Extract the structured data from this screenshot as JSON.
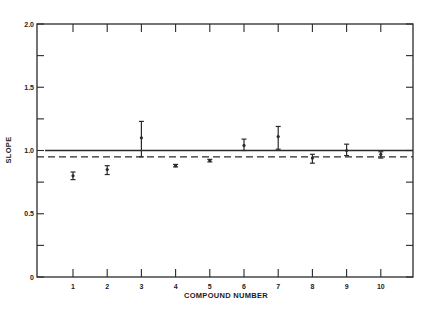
{
  "chart_data": {
    "type": "scatter",
    "title": "",
    "xlabel": "COMPOUND NUMBER",
    "ylabel": "SLOPE",
    "xlim": [
      0,
      11
    ],
    "ylim": [
      0,
      2.0
    ],
    "x_ticks": [
      "1",
      "2",
      "3",
      "4",
      "5",
      "6",
      "7",
      "8",
      "9",
      "10"
    ],
    "y_ticks": [
      "0",
      "0.5",
      "1.0",
      "1.5",
      "2.0"
    ],
    "y_minor_ticks": [
      0.25,
      0.75,
      1.25,
      1.75
    ],
    "grid": false,
    "legend": null,
    "series": [
      {
        "name": "slope",
        "style": "point-with-error-bars",
        "points": [
          {
            "x": 1,
            "y": 0.8,
            "err_low": 0.77,
            "err_high": 0.83
          },
          {
            "x": 2,
            "y": 0.85,
            "err_low": 0.81,
            "err_high": 0.88
          },
          {
            "x": 3,
            "y": 1.1,
            "err_low": 0.95,
            "err_high": 1.23
          },
          {
            "x": 4,
            "y": 0.88,
            "err_low": 0.87,
            "err_high": 0.89
          },
          {
            "x": 5,
            "y": 0.92,
            "err_low": 0.91,
            "err_high": 0.93
          },
          {
            "x": 6,
            "y": 1.04,
            "err_low": 1.0,
            "err_high": 1.09
          },
          {
            "x": 7,
            "y": 1.11,
            "err_low": 1.01,
            "err_high": 1.19
          },
          {
            "x": 8,
            "y": 0.94,
            "err_low": 0.9,
            "err_high": 0.97
          },
          {
            "x": 9,
            "y": 1.0,
            "err_low": 0.96,
            "err_high": 1.05
          },
          {
            "x": 10,
            "y": 0.97,
            "err_low": 0.94,
            "err_high": 0.99
          }
        ]
      }
    ],
    "reference_lines": [
      {
        "name": "solid-reference",
        "y": 1.0,
        "style": "solid"
      },
      {
        "name": "dashed-mean",
        "y": 0.95,
        "style": "dashed"
      }
    ]
  }
}
